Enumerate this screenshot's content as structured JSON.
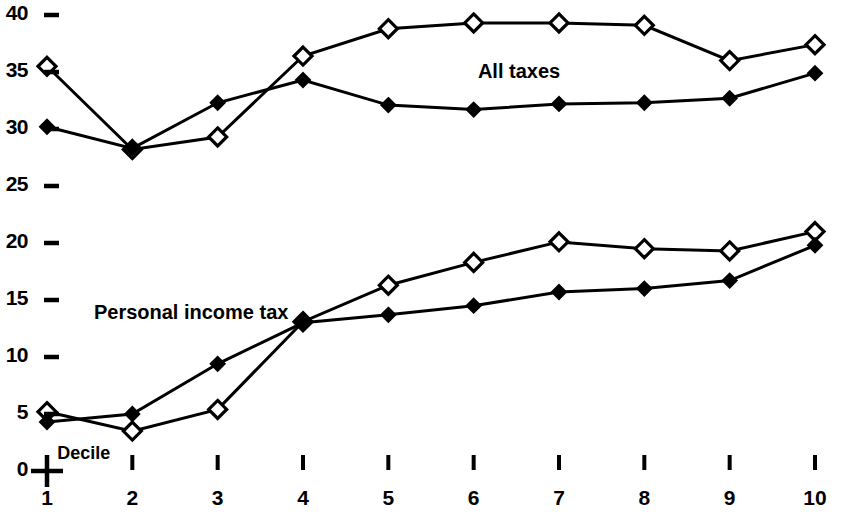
{
  "chart_data": {
    "type": "line",
    "title": "",
    "subtitle": "",
    "xlabel": "Decile",
    "ylabel": "",
    "grid": false,
    "legend_position": "inline-annotation",
    "xlim": [
      1,
      10
    ],
    "ylim": [
      0,
      41
    ],
    "x": [
      1,
      2,
      3,
      4,
      5,
      6,
      7,
      8,
      9,
      10
    ],
    "categories": [
      "1",
      "2",
      "3",
      "4",
      "5",
      "6",
      "7",
      "8",
      "9",
      "10"
    ],
    "y_ticks": [
      0,
      5,
      10,
      15,
      20,
      25,
      30,
      35,
      40
    ],
    "y_tick_labels": [
      "0",
      "5",
      "10",
      "15",
      "20",
      "25",
      "30",
      "35",
      "40"
    ],
    "x_tick_labels": [
      "1",
      "2",
      "3",
      "4",
      "5",
      "6",
      "7",
      "8",
      "9",
      "10"
    ],
    "annotations": [
      {
        "text": "All taxes",
        "x": 6.05,
        "y": 35.2
      },
      {
        "text": "Personal income tax",
        "x": 1.55,
        "y": 14.0
      },
      {
        "text": "Decile",
        "x": 1.12,
        "y": 1.55
      }
    ],
    "series": [
      {
        "name": "All taxes — open diamond",
        "group": "All taxes",
        "marker": "open-diamond",
        "values": [
          35.5,
          28.2,
          29.3,
          36.4,
          38.8,
          39.3,
          39.3,
          39.1,
          36.0,
          37.4
        ]
      },
      {
        "name": "All taxes — filled diamond",
        "group": "All taxes",
        "marker": "filled-diamond",
        "values": [
          30.2,
          28.3,
          32.3,
          34.3,
          32.1,
          31.7,
          32.2,
          32.3,
          32.7,
          34.9
        ]
      },
      {
        "name": "Personal income tax — open diamond",
        "group": "Personal income tax",
        "marker": "open-diamond",
        "values": [
          5.2,
          3.5,
          5.4,
          13.1,
          16.3,
          18.3,
          20.1,
          19.5,
          19.3,
          21.0
        ]
      },
      {
        "name": "Personal income tax — filled diamond",
        "group": "Personal income tax",
        "marker": "filled-diamond",
        "values": [
          4.3,
          5.0,
          9.4,
          13.0,
          13.7,
          14.5,
          15.7,
          16.0,
          16.7,
          19.8
        ]
      }
    ],
    "colors": {
      "line": "#000000",
      "marker_fill_open": "#ffffff",
      "marker_fill_solid": "#000000",
      "background": "#ffffff",
      "text": "#000000"
    },
    "origin_marker": "plus-sign"
  }
}
